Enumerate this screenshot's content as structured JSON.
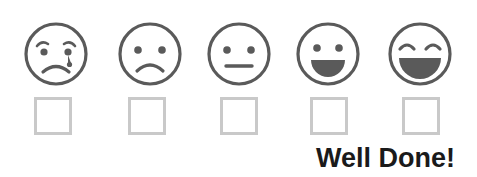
{
  "widget": {
    "name": "mood-rating-scale",
    "stroke_color": "#5a5a5a",
    "fill_color": "#5a5a5a",
    "checkbox_border_color": "#c9c9c9",
    "text_color": "#1a1a1a",
    "background_color": "#ffffff"
  },
  "faces": [
    {
      "id": "face-crying",
      "icon": "crying-face-icon",
      "label": "Crying face",
      "left": 22,
      "eyebrows": true,
      "tear": true,
      "mouth": "frown"
    },
    {
      "id": "face-sad",
      "icon": "sad-face-icon",
      "label": "Sad face",
      "left": 116,
      "eyebrows": false,
      "tear": false,
      "mouth": "frown"
    },
    {
      "id": "face-neutral",
      "icon": "neutral-face-icon",
      "label": "Neutral face",
      "left": 205,
      "eyebrows": false,
      "tear": false,
      "mouth": "straight"
    },
    {
      "id": "face-happy",
      "icon": "happy-face-icon",
      "label": "Happy face",
      "left": 294,
      "eyebrows": false,
      "tear": false,
      "mouth": "open-smile"
    },
    {
      "id": "face-laughing",
      "icon": "laughing-face-icon",
      "label": "Laughing face",
      "left": 386,
      "eyebrows": false,
      "tear": false,
      "mouth": "big-open-smile"
    }
  ],
  "checkboxes": [
    {
      "id": "checkbox-crying",
      "left": 34,
      "checked": false
    },
    {
      "id": "checkbox-sad",
      "left": 128,
      "checked": false
    },
    {
      "id": "checkbox-neutral",
      "left": 220,
      "checked": false
    },
    {
      "id": "checkbox-happy",
      "left": 310,
      "checked": false
    },
    {
      "id": "checkbox-laughing",
      "left": 402,
      "checked": false
    }
  ],
  "message": {
    "text": "Well Done!"
  }
}
